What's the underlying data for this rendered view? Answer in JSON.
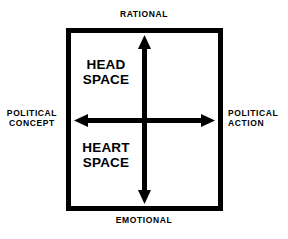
{
  "diagram": {
    "type": "quadrant-matrix",
    "title": "",
    "colors": {
      "stroke": "#000000",
      "background": "#ffffff",
      "text": "#000000"
    },
    "frame": {
      "border_width_px": 5,
      "x": 66,
      "y": 28,
      "width": 157,
      "height": 183
    },
    "axes": {
      "vertical": {
        "name": "rational-emotional-axis",
        "top_label": "RATIONAL",
        "bottom_label": "EMOTIONAL",
        "double_headed": true
      },
      "horizontal": {
        "name": "political-concept-action-axis",
        "left_label": "POLITICAL\nCONCEPT",
        "right_label": "POLITICAL\nACTION",
        "double_headed": true
      }
    },
    "quadrant_labels": [
      {
        "id": "head-space",
        "text": "HEAD\nSPACE",
        "position": "upper-left"
      },
      {
        "id": "heart-space",
        "text": "HEART\nSPACE",
        "position": "lower-left"
      }
    ]
  }
}
